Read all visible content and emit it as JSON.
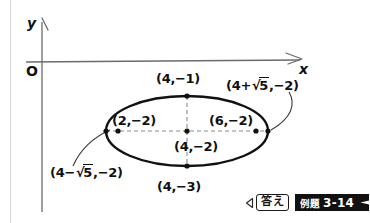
{
  "figure": {
    "type": "ellipse-diagram",
    "axes": {
      "y_label": "y",
      "x_label": "x",
      "origin_label": "O"
    },
    "points": [
      {
        "name": "top-vertex",
        "label": "(4,−1)",
        "role": "co-vertex"
      },
      {
        "name": "left-vertex",
        "label": "(2,−2)",
        "role": "vertex"
      },
      {
        "name": "right-vertex",
        "label": "(6,−2)",
        "role": "vertex"
      },
      {
        "name": "center",
        "label": "(4,−2)",
        "role": "center"
      },
      {
        "name": "bottom-vertex",
        "label": "(4,−3)",
        "role": "co-vertex"
      }
    ],
    "focus_right": {
      "prefix": "(4+",
      "radical": "5",
      "suffix": ",−2)"
    },
    "focus_left": {
      "prefix": "(4−",
      "radical": "5",
      "suffix": ",−2)"
    },
    "radical_symbol": "√"
  },
  "badges": {
    "answer_label": "答え",
    "example_jp": "例題",
    "example_number": "3-14"
  },
  "colors": {
    "ink": "#111111",
    "axis": "#6b6b6b",
    "dashed": "#8a8a8a",
    "banner": "#111111",
    "page_rule": "#d8d8d8"
  }
}
